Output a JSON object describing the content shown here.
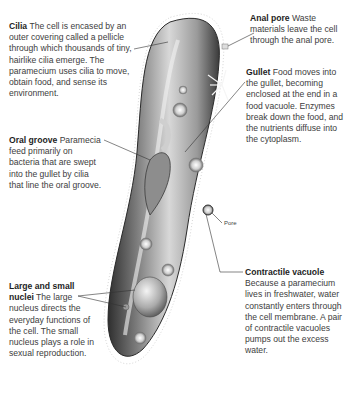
{
  "diagram": {
    "subject": "Paramecium",
    "colors": {
      "cell_dark": "#3c3c3c",
      "cell_mid": "#8a8a8a",
      "cell_light": "#e6e6e6",
      "text": "#3d3d3d",
      "leader": "#333333"
    },
    "labels": {
      "cilia": {
        "title": "Cilia",
        "text": "The cell is encased by an outer covering called a pellicle through which thousands of tiny, hairlike cilia emerge. The paramecium uses cilia to move, obtain food, and sense its environment."
      },
      "anal_pore": {
        "title": "Anal pore",
        "text": "Waste materials leave the cell through the anal pore."
      },
      "gullet": {
        "title": "Gullet",
        "text": "Food moves into the gullet, becoming enclosed at the end in a food vacuole. Enzymes break down the food, and the nutrients diffuse into the cytoplasm."
      },
      "oral_groove": {
        "title": "Oral groove",
        "text": "Paramecia feed primarily on bacteria that are swept into the gullet by cilia that line the oral groove."
      },
      "nuclei": {
        "title": "Large and small nuclei",
        "text": "The large nucleus directs the everyday functions of the cell. The small nucleus plays a role in sexual reproduction."
      },
      "contractile_vacuole": {
        "title": "Contractile vacuole",
        "text": "Because a paramecium lives in freshwater, water constantly enters through the cell membrane. A pair of contractile vacuoles pumps out the excess water."
      },
      "pore": {
        "title": "Pore"
      }
    }
  }
}
